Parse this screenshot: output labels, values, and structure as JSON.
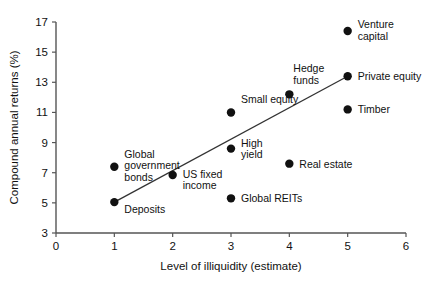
{
  "chart_data": {
    "type": "scatter",
    "title": "",
    "xlabel": "Level of illiquidity (estimate)",
    "ylabel": "Compound annual returns (%)",
    "xlim": [
      0,
      6
    ],
    "ylim": [
      3,
      17
    ],
    "xticks": [
      "0",
      "1",
      "2",
      "3",
      "4",
      "5",
      "6"
    ],
    "yticks": [
      "3",
      "5",
      "7",
      "9",
      "11",
      "13",
      "15",
      "17"
    ],
    "grid": false,
    "legend": "none",
    "marker_color": "#111111",
    "trend_line": {
      "name": "trend-line",
      "x": [
        1,
        5
      ],
      "y": [
        5.05,
        13.4
      ]
    },
    "points": [
      {
        "label": "Deposits",
        "x": 1,
        "y": 5.05,
        "label_dx": 10,
        "label_dy": 11,
        "anchor": "start",
        "lines": [
          "Deposits"
        ]
      },
      {
        "label": "Global government bonds",
        "x": 1,
        "y": 7.4,
        "label_dx": 10,
        "label_dy": -9,
        "anchor": "start",
        "lines": [
          "Global",
          "government",
          "bonds"
        ]
      },
      {
        "label": "US fixed income",
        "x": 2,
        "y": 6.85,
        "label_dx": 10,
        "label_dy": 3,
        "anchor": "start",
        "lines": [
          "US fixed",
          "income"
        ]
      },
      {
        "label": "Small equity",
        "x": 3,
        "y": 11.0,
        "label_dx": 10,
        "label_dy": -9,
        "anchor": "start",
        "lines": [
          "Small equity"
        ]
      },
      {
        "label": "High yield",
        "x": 3,
        "y": 8.6,
        "label_dx": 10,
        "label_dy": -2,
        "anchor": "start",
        "lines": [
          "High",
          "yield"
        ]
      },
      {
        "label": "Global REITs",
        "x": 3,
        "y": 5.3,
        "label_dx": 10,
        "label_dy": 4,
        "anchor": "start",
        "lines": [
          "Global REITs"
        ]
      },
      {
        "label": "Hedge funds",
        "x": 4,
        "y": 12.2,
        "label_dx": 4,
        "label_dy": -22,
        "anchor": "start",
        "lines": [
          "Hedge",
          "funds"
        ]
      },
      {
        "label": "Real estate",
        "x": 4,
        "y": 7.6,
        "label_dx": 10,
        "label_dy": 4,
        "anchor": "start",
        "lines": [
          "Real estate"
        ]
      },
      {
        "label": "Venture capital",
        "x": 5,
        "y": 16.4,
        "label_dx": 10,
        "label_dy": -3,
        "anchor": "start",
        "lines": [
          "Venture",
          "capital"
        ]
      },
      {
        "label": "Private equity",
        "x": 5,
        "y": 13.4,
        "label_dx": 10,
        "label_dy": 4,
        "anchor": "start",
        "lines": [
          "Private equity"
        ]
      },
      {
        "label": "Timber",
        "x": 5,
        "y": 11.2,
        "label_dx": 10,
        "label_dy": 4,
        "anchor": "start",
        "lines": [
          "Timber"
        ]
      }
    ]
  }
}
